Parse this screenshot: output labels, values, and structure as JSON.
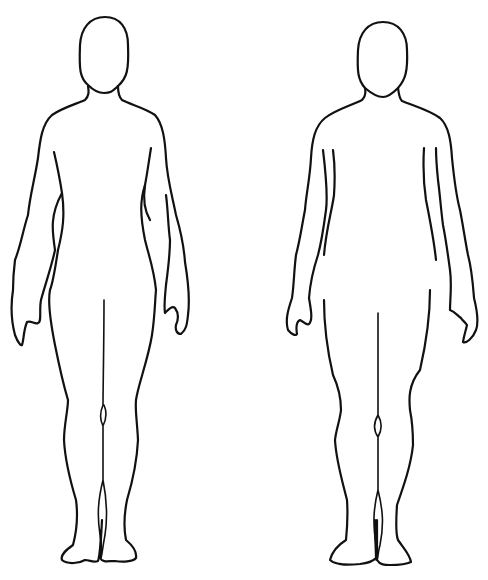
{
  "figure": {
    "background": "#ffffff",
    "stroke_color": "#111111",
    "figures": [
      {
        "name": "female-outline",
        "position": "left"
      },
      {
        "name": "male-outline",
        "position": "right"
      }
    ]
  }
}
